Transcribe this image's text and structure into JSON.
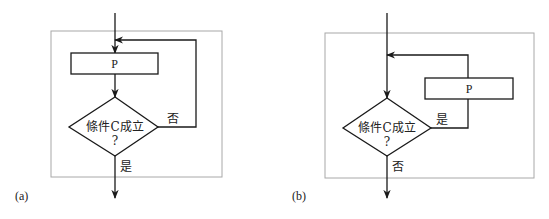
{
  "colors": {
    "line": "#1a1a1a",
    "frame": "#a8a8a8",
    "background": "#ffffff"
  },
  "panels": [
    {
      "caption": "(a)",
      "process_label": "P",
      "condition_line1": "條件C成立",
      "condition_line2": "?",
      "branch_loop_label": "否",
      "branch_exit_label": "是"
    },
    {
      "caption": "(b)",
      "process_label": "P",
      "condition_line1": "條件C成立",
      "condition_line2": "?",
      "branch_loop_label": "是",
      "branch_exit_label": "否"
    }
  ]
}
